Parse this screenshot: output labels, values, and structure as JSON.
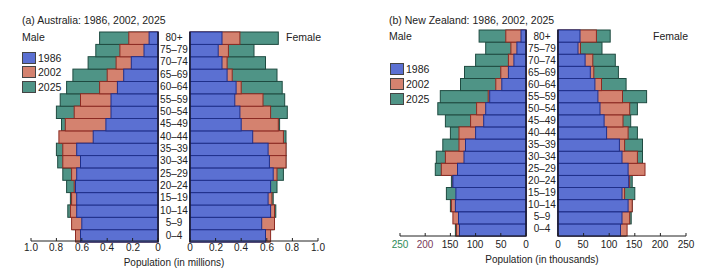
{
  "chart_data": [
    {
      "type": "bar",
      "subtype": "population-pyramid",
      "title": "(a) Australia: 1986, 2002, 2025",
      "xlabel": "Population (in millions)",
      "ylabel": "",
      "left_label": "Male",
      "right_label": "Female",
      "categories": [
        "0–4",
        "5–9",
        "10–14",
        "15–19",
        "20–24",
        "25–29",
        "30–34",
        "35–39",
        "40–44",
        "45–49",
        "50–54",
        "55–59",
        "60–64",
        "65–69",
        "70–74",
        "75–79",
        "80+"
      ],
      "x_ticks_male": [
        "1.0",
        "0.8",
        "0.6",
        "0.4",
        "0.2",
        "0"
      ],
      "x_ticks_female": [
        "0",
        "0.2",
        "0.4",
        "0.6",
        "0.8",
        "1.0"
      ],
      "xlim": [
        0,
        1.0
      ],
      "legend": [
        "1986",
        "2002",
        "2025"
      ],
      "legend_position": "left",
      "grid": false,
      "series": [
        {
          "name": "1986",
          "sex": "Male",
          "values": [
            0.61,
            0.6,
            0.64,
            0.64,
            0.65,
            0.64,
            0.61,
            0.64,
            0.51,
            0.41,
            0.37,
            0.37,
            0.32,
            0.27,
            0.21,
            0.11,
            0.07
          ]
        },
        {
          "name": "2002",
          "sex": "Male",
          "values": [
            0.65,
            0.68,
            0.69,
            0.68,
            0.66,
            0.68,
            0.75,
            0.75,
            0.78,
            0.73,
            0.66,
            0.61,
            0.46,
            0.4,
            0.33,
            0.3,
            0.23
          ]
        },
        {
          "name": "2025",
          "sex": "Male",
          "values": [
            0.64,
            0.67,
            0.71,
            0.69,
            0.72,
            0.75,
            0.79,
            0.8,
            0.76,
            0.76,
            0.8,
            0.77,
            0.72,
            0.67,
            0.55,
            0.49,
            0.46
          ]
        },
        {
          "name": "1986",
          "sex": "Female",
          "values": [
            0.59,
            0.56,
            0.63,
            0.61,
            0.63,
            0.65,
            0.62,
            0.61,
            0.49,
            0.4,
            0.39,
            0.35,
            0.36,
            0.29,
            0.25,
            0.22,
            0.25
          ]
        },
        {
          "name": "2002",
          "sex": "Female",
          "values": [
            0.63,
            0.66,
            0.66,
            0.64,
            0.62,
            0.68,
            0.75,
            0.75,
            0.73,
            0.69,
            0.63,
            0.57,
            0.4,
            0.33,
            0.29,
            0.3,
            0.39
          ]
        },
        {
          "name": "2025",
          "sex": "Female",
          "values": [
            0.62,
            0.65,
            0.67,
            0.65,
            0.68,
            0.73,
            0.75,
            0.75,
            0.75,
            0.7,
            0.76,
            0.74,
            0.72,
            0.68,
            0.59,
            0.5,
            0.69
          ]
        }
      ]
    },
    {
      "type": "bar",
      "subtype": "population-pyramid",
      "title": "(b) New Zealand: 1986, 2002, 2025",
      "xlabel": "Population (in thousands)",
      "ylabel": "",
      "left_label": "Male",
      "right_label": "Female",
      "categories": [
        "0–4",
        "5–9",
        "10–14",
        "15–19",
        "20–24",
        "25–29",
        "30–34",
        "35–39",
        "40–44",
        "45–49",
        "50–54",
        "55–59",
        "60–64",
        "65–69",
        "70–74",
        "75–79",
        "80+"
      ],
      "x_ticks_male": [
        "250",
        "200",
        "150",
        "100",
        "50",
        "0"
      ],
      "x_ticks_female": [
        "0",
        "50",
        "100",
        "150",
        "200",
        "250"
      ],
      "xlim": [
        0,
        250
      ],
      "legend": [
        "1986",
        "2002",
        "2025"
      ],
      "legend_position": "left",
      "grid": false,
      "series": [
        {
          "name": "1986",
          "sex": "Male",
          "values": [
            132,
            134,
            140,
            139,
            145,
            136,
            123,
            120,
            100,
            84,
            80,
            72,
            48,
            35,
            24,
            18,
            10
          ]
        },
        {
          "name": "2002",
          "sex": "Male",
          "values": [
            138,
            145,
            148,
            137,
            145,
            168,
            160,
            133,
            133,
            110,
            98,
            75,
            60,
            50,
            35,
            30,
            40
          ]
        },
        {
          "name": "2025",
          "sex": "Male",
          "values": [
            140,
            140,
            150,
            158,
            148,
            180,
            178,
            165,
            150,
            160,
            175,
            170,
            130,
            122,
            100,
            80,
            93
          ]
        },
        {
          "name": "1986",
          "sex": "Female",
          "values": [
            122,
            125,
            137,
            125,
            138,
            137,
            125,
            120,
            95,
            90,
            82,
            78,
            72,
            63,
            53,
            39,
            43
          ]
        },
        {
          "name": "2002",
          "sex": "Female",
          "values": [
            135,
            140,
            145,
            130,
            140,
            170,
            155,
            130,
            137,
            127,
            140,
            126,
            85,
            70,
            68,
            44,
            75
          ]
        },
        {
          "name": "2025",
          "sex": "Female",
          "values": [
            132,
            143,
            145,
            150,
            145,
            155,
            165,
            165,
            155,
            142,
            155,
            173,
            133,
            118,
            112,
            86,
            102
          ]
        }
      ]
    }
  ],
  "colors": {
    "1986": "#5b70d2",
    "2002": "#d4826f",
    "2025": "#4f9486",
    "1986_edge": "#1f2f8a",
    "2002_edge": "#8c2a22",
    "2025_edge": "#1e4a40",
    "axis": "#222222"
  },
  "panels": {
    "a": {
      "title": "(a) Australia: 1986, 2002, 2025",
      "male": "Male",
      "female": "Female",
      "legend": [
        "1986",
        "2002",
        "2025"
      ],
      "xlabel": "Population (in millions)"
    },
    "b": {
      "title": "(b) New Zealand: 1986, 2002, 2025",
      "male": "Male",
      "female": "Female",
      "legend": [
        "1986",
        "2002",
        "2025"
      ],
      "xlabel": "Population (in thousands)"
    }
  }
}
